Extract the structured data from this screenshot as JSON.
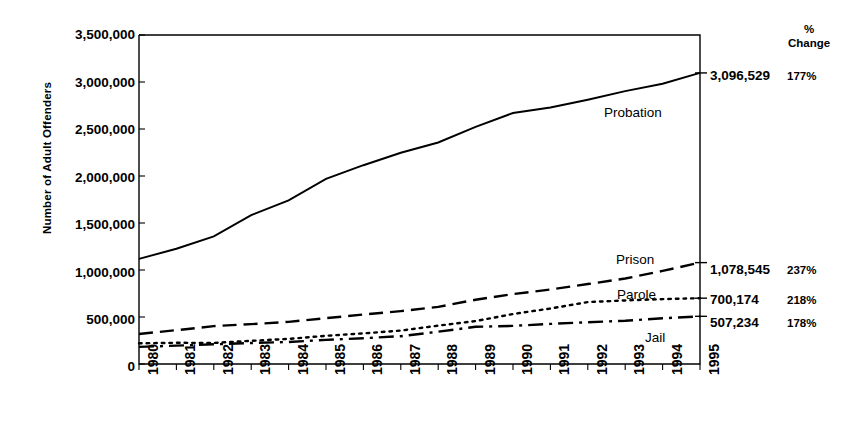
{
  "chart_data": {
    "type": "line",
    "title": "",
    "xlabel": "",
    "ylabel": "Number of Adult Offenders",
    "x": [
      1980,
      1981,
      1982,
      1983,
      1984,
      1985,
      1986,
      1987,
      1988,
      1989,
      1990,
      1991,
      1992,
      1993,
      1994,
      1995
    ],
    "xtick_labels": [
      "1980",
      "1981",
      "1982",
      "1983",
      "1984",
      "1985",
      "1986",
      "1987",
      "1988",
      "1989",
      "1990",
      "1991",
      "1992",
      "1993",
      "1994",
      "1995"
    ],
    "ytick_labels": [
      "0",
      "500,000",
      "1,000,000",
      "1,500,000",
      "2,000,000",
      "2,500,000",
      "3,000,000",
      "3,500,000"
    ],
    "ytick_values": [
      0,
      500000,
      1000000,
      1500000,
      2000000,
      2500000,
      3000000,
      3500000
    ],
    "ylim": [
      0,
      3500000
    ],
    "grid": false,
    "legend_position": "inline-right",
    "series": [
      {
        "name": "Probation",
        "style": "solid",
        "end_value_label": "3,096,529",
        "pct_change_label": "177%",
        "values": [
          1118097,
          1225934,
          1357264,
          1582947,
          1740948,
          1968712,
          2114621,
          2247158,
          2356483,
          2522125,
          2670234,
          2728472,
          2811611,
          2903061,
          2981022,
          3096529
        ]
      },
      {
        "name": "Prison",
        "style": "dashed",
        "end_value_label": "1,078,545",
        "pct_change_label": "237%",
        "values": [
          319598,
          360029,
          402914,
          423898,
          448264,
          487593,
          526436,
          562814,
          607766,
          683367,
          743382,
          792535,
          850566,
          909381,
          990147,
          1078545
        ]
      },
      {
        "name": "Parole",
        "style": "dotted",
        "end_value_label": "700,174",
        "pct_change_label": "218%",
        "values": [
          220438,
          225539,
          224604,
          246440,
          266992,
          300203,
          325638,
          355505,
          407977,
          456803,
          531407,
          590442,
          658601,
          676100,
          690371,
          700174
        ]
      },
      {
        "name": "Jail",
        "style": "dashdot",
        "end_value_label": "507,234",
        "pct_change_label": "178%",
        "values": [
          182288,
          195085,
          209582,
          223551,
          234500,
          256615,
          274444,
          295873,
          343569,
          395553,
          405320,
          426479,
          444584,
          459804,
          486474,
          507234
        ]
      }
    ],
    "right_column_header": "%\nChange",
    "right_column_header_line1": "%",
    "right_column_header_line2": "Change"
  },
  "axis": {
    "y_title": "Number of Adult Offenders"
  }
}
